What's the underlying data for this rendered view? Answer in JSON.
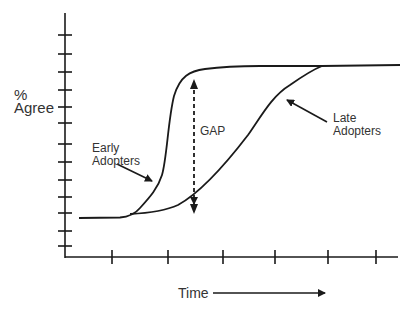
{
  "diagram": {
    "y_axis_label_line1": "%",
    "y_axis_label_line2": "Agree",
    "x_axis_label": "Time",
    "gap_label": "GAP",
    "early_label_line1": "Early",
    "early_label_line2": "Adopters",
    "late_label_line1": "Late",
    "late_label_line2": "Adopters",
    "y_tick_count": 13,
    "x_tick_count": 6,
    "line_color": "#1a1a1a"
  }
}
